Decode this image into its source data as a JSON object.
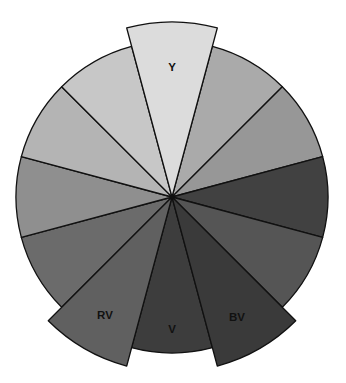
{
  "diagram": {
    "title": "",
    "type": "color-wheel",
    "center": {
      "x": 172,
      "y": 197
    },
    "radius": 156,
    "extended_radius": 175,
    "wedges": [
      {
        "id": "Y",
        "label": "Y",
        "start_deg": -105,
        "end_deg": -75,
        "fill": "#dcdcdc",
        "extended": true,
        "label_pos": {
          "x": 172,
          "y": 68
        }
      },
      {
        "id": "YG",
        "label": "",
        "start_deg": -75,
        "end_deg": -45,
        "fill": "#aaaaaa",
        "extended": false
      },
      {
        "id": "G",
        "label": "",
        "start_deg": -45,
        "end_deg": -15,
        "fill": "#979797",
        "extended": false
      },
      {
        "id": "BG",
        "label": "",
        "start_deg": -15,
        "end_deg": 15,
        "fill": "#414141",
        "extended": false
      },
      {
        "id": "B",
        "label": "",
        "start_deg": 15,
        "end_deg": 45,
        "fill": "#555555",
        "extended": false
      },
      {
        "id": "BV",
        "label": "BV",
        "start_deg": 45,
        "end_deg": 75,
        "fill": "#3a3a3a",
        "extended": true,
        "label_pos": {
          "x": 237,
          "y": 318
        }
      },
      {
        "id": "V",
        "label": "V",
        "start_deg": 75,
        "end_deg": 105,
        "fill": "#3d3d3d",
        "extended": false,
        "label_pos": {
          "x": 172,
          "y": 330
        }
      },
      {
        "id": "RV",
        "label": "RV",
        "start_deg": 105,
        "end_deg": 135,
        "fill": "#606060",
        "extended": true,
        "label_pos": {
          "x": 105,
          "y": 316
        }
      },
      {
        "id": "R",
        "label": "",
        "start_deg": 135,
        "end_deg": 165,
        "fill": "#6b6b6b",
        "extended": false
      },
      {
        "id": "RO",
        "label": "",
        "start_deg": 165,
        "end_deg": 195,
        "fill": "#8f8f8f",
        "extended": false
      },
      {
        "id": "O",
        "label": "",
        "start_deg": 195,
        "end_deg": 225,
        "fill": "#b4b4b4",
        "extended": false
      },
      {
        "id": "YO",
        "label": "",
        "start_deg": 225,
        "end_deg": 255,
        "fill": "#c7c7c7",
        "extended": false
      }
    ],
    "visible_labels": [
      "Y",
      "RV",
      "V",
      "BV"
    ]
  }
}
